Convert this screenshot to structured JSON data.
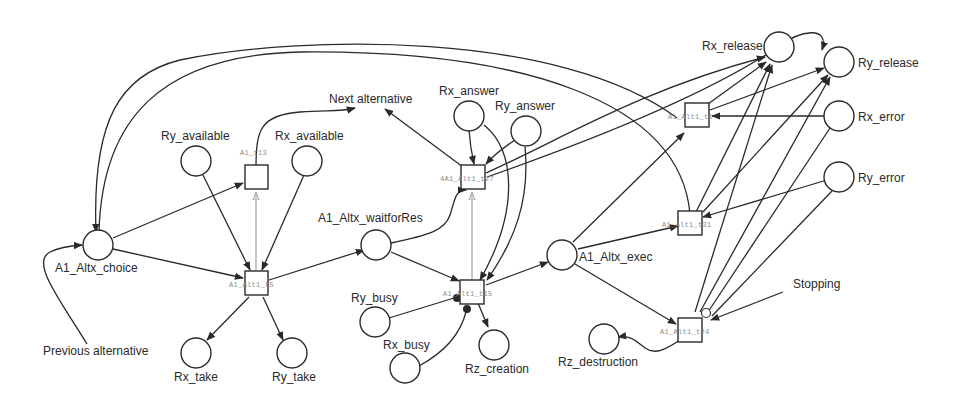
{
  "diagram": {
    "type": "petri-net",
    "colors": {
      "stroke": "#2a2a2a",
      "test_arc": "#9a9a9a",
      "transition_label": "#8a8a8a",
      "background": "#ffffff"
    },
    "places": {
      "a1_altx_choice": {
        "label": "A1_Altx_choice"
      },
      "ry_available": {
        "label": "Ry_available"
      },
      "rx_available": {
        "label": "Rx_available"
      },
      "rx_take": {
        "label": "Rx_take"
      },
      "ry_take": {
        "label": "Ry_take"
      },
      "a1_altx_waitforres": {
        "label": "A1_Altx_waitforRes"
      },
      "rx_answer": {
        "label": "Rx_answer"
      },
      "ry_answer": {
        "label": "Ry_answer"
      },
      "ry_busy": {
        "label": "Ry_busy"
      },
      "rx_busy": {
        "label": "Rx_busy"
      },
      "rz_creation": {
        "label": "Rz_creation"
      },
      "a1_altx_exec": {
        "label": "A1_Altx_exec"
      },
      "rx_release": {
        "label": "Rx_release"
      },
      "ry_release": {
        "label": "Ry_release"
      },
      "rx_error": {
        "label": "Rx_error"
      },
      "ry_error": {
        "label": "Ry_error"
      },
      "rz_destruction": {
        "label": "Rz_destruction"
      }
    },
    "transitions": {
      "t13": {
        "label": "A1_t13"
      },
      "t5": {
        "label": "A1_Alt1_t5"
      },
      "t27": {
        "label": "4A1_Alt1_t27"
      },
      "t15": {
        "label": "A1_Alt1_t15"
      },
      "t1": {
        "label": "A1_Alt1_t1"
      },
      "t31": {
        "label": "A1_Alt1_t31"
      },
      "t24": {
        "label": "A1_Alt1_t24"
      }
    },
    "annotations": {
      "next_alternative": "Next alternative",
      "previous_alternative": "Previous alternative",
      "stopping": "Stopping"
    }
  }
}
